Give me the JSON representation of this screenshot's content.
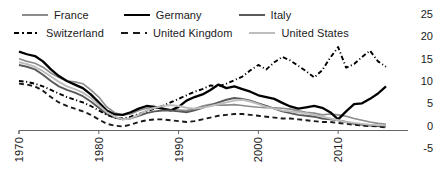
{
  "legend": {
    "rows": [
      [
        {
          "label": "France",
          "style": "solid",
          "color": "#8c8c8c",
          "width": 1.8,
          "name": "legend-item-france"
        },
        {
          "label": "Germany",
          "style": "solid",
          "color": "#000000",
          "width": 2.6,
          "name": "legend-item-germany"
        },
        {
          "label": "Italy",
          "style": "solid",
          "color": "#5a5a5a",
          "width": 2.0,
          "name": "legend-item-italy"
        }
      ],
      [
        {
          "label": "Switzerland",
          "style": "dashdot",
          "color": "#000000",
          "width": 2.2,
          "name": "legend-item-switzerland"
        },
        {
          "label": "United Kingdom",
          "style": "dashed",
          "color": "#1a1a1a",
          "width": 2.2,
          "name": "legend-item-united-kingdom"
        },
        {
          "label": "United States",
          "style": "solid",
          "color": "#bdbdbd",
          "width": 2.0,
          "name": "legend-item-united-states"
        }
      ]
    ]
  },
  "axes": {
    "y_ticks": [
      "25",
      "20",
      "15",
      "10",
      "5",
      "0",
      "-5"
    ],
    "x_ticks": [
      "1970",
      "1980",
      "1990",
      "2000",
      "2010"
    ]
  },
  "chart_data": {
    "type": "line",
    "title": "",
    "subtitle": "",
    "xlabel": "",
    "ylabel": "",
    "xlim": [
      1970,
      2016
    ],
    "ylim": [
      -5,
      25
    ],
    "yticks": [
      -5,
      0,
      5,
      10,
      15,
      20,
      25
    ],
    "xticks": [
      1970,
      1980,
      1990,
      2000,
      2010
    ],
    "grid": false,
    "legend_position": "top-left",
    "x": [
      1970,
      1971,
      1972,
      1973,
      1974,
      1975,
      1976,
      1977,
      1978,
      1979,
      1980,
      1981,
      1982,
      1983,
      1984,
      1985,
      1986,
      1987,
      1988,
      1989,
      1990,
      1991,
      1992,
      1993,
      1994,
      1995,
      1996,
      1997,
      1998,
      1999,
      2000,
      2001,
      2002,
      2003,
      2004,
      2005,
      2006,
      2007,
      2008,
      2009,
      2010,
      2011,
      2012,
      2013,
      2014,
      2015,
      2016
    ],
    "series": [
      {
        "name": "France",
        "style": "solid",
        "color": "#8c8c8c",
        "width": 1.6,
        "values": [
          15.2,
          14.6,
          14.2,
          13.3,
          12.0,
          11.0,
          10.2,
          10.0,
          9.6,
          8.2,
          6.6,
          4.4,
          3.1,
          2.6,
          2.8,
          3.6,
          4.1,
          4.2,
          4.0,
          3.8,
          3.7,
          3.6,
          4.0,
          4.6,
          5.0,
          4.8,
          4.8,
          4.9,
          4.7,
          4.5,
          4.3,
          4.2,
          4.2,
          4.1,
          3.9,
          3.5,
          3.2,
          3.0,
          2.6,
          2.8,
          2.6,
          2.3,
          1.8,
          1.4,
          1.0,
          0.7,
          0.5
        ]
      },
      {
        "name": "Germany",
        "style": "solid",
        "color": "#000000",
        "width": 2.3,
        "values": [
          16.8,
          16.2,
          15.8,
          14.6,
          12.8,
          11.3,
          10.2,
          9.4,
          8.6,
          7.2,
          5.4,
          3.6,
          2.7,
          2.6,
          3.2,
          4.0,
          4.6,
          4.4,
          4.0,
          3.6,
          4.4,
          5.8,
          6.6,
          7.2,
          8.2,
          9.4,
          8.6,
          9.0,
          8.4,
          7.8,
          7.0,
          6.6,
          6.2,
          5.3,
          4.5,
          4.0,
          4.3,
          4.6,
          4.2,
          3.2,
          1.6,
          3.4,
          5.0,
          5.2,
          6.2,
          7.4,
          9.0
        ]
      },
      {
        "name": "Italy",
        "style": "solid",
        "color": "#5a5a5a",
        "width": 1.9,
        "values": [
          13.8,
          13.4,
          12.8,
          11.6,
          10.2,
          9.0,
          8.2,
          7.6,
          6.8,
          5.6,
          4.2,
          2.8,
          2.0,
          1.6,
          1.8,
          2.4,
          3.0,
          3.4,
          3.6,
          3.6,
          3.4,
          3.2,
          3.6,
          4.2,
          4.8,
          5.4,
          6.0,
          6.4,
          6.2,
          5.8,
          5.2,
          4.6,
          4.0,
          3.4,
          3.0,
          2.6,
          2.4,
          2.2,
          1.8,
          1.6,
          1.4,
          1.0,
          0.6,
          0.4,
          0.2,
          0.1,
          0.0
        ]
      },
      {
        "name": "Switzerland",
        "style": "dashdot",
        "color": "#000000",
        "width": 1.9,
        "values": [
          10.2,
          10.0,
          9.6,
          9.0,
          8.2,
          7.4,
          6.6,
          6.0,
          5.4,
          4.6,
          3.6,
          2.6,
          2.0,
          1.8,
          2.2,
          2.8,
          3.4,
          4.0,
          4.6,
          5.4,
          6.2,
          7.0,
          7.8,
          8.4,
          9.2,
          9.0,
          9.6,
          10.4,
          11.2,
          12.6,
          13.8,
          12.8,
          14.4,
          15.6,
          14.8,
          13.6,
          12.4,
          11.0,
          12.6,
          15.4,
          17.8,
          13.2,
          14.0,
          15.6,
          17.0,
          14.6,
          13.4
        ]
      },
      {
        "name": "United Kingdom",
        "style": "dashed",
        "color": "#1a1a1a",
        "width": 1.9,
        "values": [
          9.6,
          9.4,
          9.0,
          8.0,
          6.6,
          5.4,
          4.6,
          4.0,
          3.4,
          2.6,
          1.6,
          0.6,
          0.2,
          0.0,
          0.4,
          1.0,
          1.4,
          1.6,
          1.6,
          1.4,
          1.2,
          1.0,
          1.2,
          1.6,
          2.0,
          2.4,
          2.6,
          2.8,
          2.8,
          2.6,
          2.4,
          2.2,
          2.0,
          1.8,
          1.8,
          1.6,
          1.4,
          1.2,
          1.0,
          1.0,
          0.8,
          0.6,
          0.4,
          0.2,
          0.1,
          0.0,
          -0.2
        ]
      },
      {
        "name": "United States",
        "style": "solid",
        "color": "#bdbdbd",
        "width": 1.9,
        "values": [
          14.4,
          14.0,
          13.4,
          12.4,
          11.2,
          10.0,
          9.0,
          8.4,
          7.6,
          6.4,
          4.8,
          3.2,
          2.2,
          1.6,
          1.8,
          2.6,
          3.6,
          4.2,
          4.6,
          4.8,
          4.6,
          4.2,
          4.0,
          4.2,
          4.6,
          5.0,
          5.4,
          5.8,
          6.0,
          5.6,
          5.0,
          4.4,
          4.0,
          3.6,
          3.4,
          3.2,
          3.0,
          2.6,
          2.2,
          1.8,
          1.4,
          1.0,
          0.8,
          0.6,
          0.4,
          0.3,
          0.2
        ]
      }
    ]
  }
}
